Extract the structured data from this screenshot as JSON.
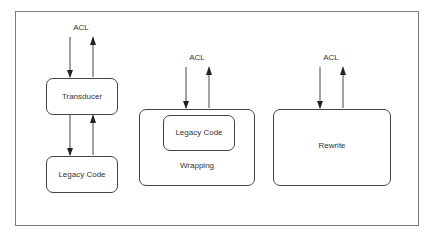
{
  "diagram": {
    "title": "",
    "panels": [
      {
        "name": "transducer-approach",
        "acl_label": "ACL",
        "boxes": [
          {
            "label": "Transducer"
          },
          {
            "label": "Legacy Code"
          }
        ]
      },
      {
        "name": "wrapping-approach",
        "acl_label": "ACL",
        "outer_label": "Wrapping",
        "inner_label": "Legacy Code"
      },
      {
        "name": "rewrite-approach",
        "acl_label": "ACL",
        "label": "Rewrite"
      }
    ],
    "colors": {
      "frame": "#7a7a7a",
      "stroke": "#444444",
      "text": "#333333",
      "background": "#ffffff"
    }
  }
}
